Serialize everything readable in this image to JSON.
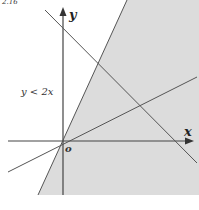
{
  "figure": {
    "title_fragment": "2.16",
    "region_label": "y < 2x",
    "axis_x_label": "x",
    "axis_y_label": "y",
    "origin_label": "o"
  },
  "colors": {
    "shade": "#dcdcdc",
    "line": "#555555",
    "axis": "#444444",
    "background": "#ffffff"
  },
  "geometry": {
    "origin": [
      63,
      141
    ],
    "shaded_region_polygon": [
      [
        38,
        195
      ],
      [
        127,
        0
      ],
      [
        199,
        0
      ],
      [
        199,
        195
      ]
    ],
    "boundary_line_y_eq_2x": [
      [
        38,
        195
      ],
      [
        127,
        0
      ]
    ],
    "line_positive_slope": [
      [
        8,
        172
      ],
      [
        197,
        77
      ]
    ],
    "line_negative_slope": [
      [
        45,
        10
      ],
      [
        197,
        163
      ]
    ],
    "x_axis": [
      [
        8,
        141
      ],
      [
        193,
        141
      ]
    ],
    "y_axis": [
      [
        63,
        195
      ],
      [
        63,
        8
      ]
    ]
  }
}
